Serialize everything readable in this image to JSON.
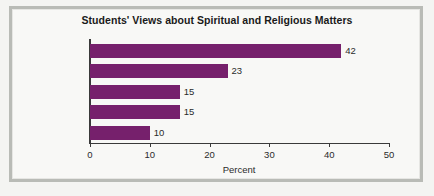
{
  "chart_data": {
    "type": "bar",
    "orientation": "horizontal",
    "title": "Students' Views about Spiritual and Religious Matters",
    "categories": [
      "Secure",
      "Seeking",
      "Conflicted",
      "Not interested",
      "Doubting"
    ],
    "values": [
      42,
      23,
      15,
      15,
      10
    ],
    "value_labels": [
      "42",
      "23",
      "15",
      "15",
      "10"
    ],
    "xlabel": "Percent",
    "ylabel": "",
    "xlim": [
      0,
      50
    ],
    "xticks": [
      0,
      10,
      20,
      30,
      40,
      50
    ],
    "xtick_labels": [
      "0",
      "10",
      "20",
      "30",
      "40",
      "50"
    ],
    "grid": false,
    "legend": false,
    "bar_color": "#76206c",
    "axis_color": "#3a3a3a",
    "background_color": "#f8f8f6",
    "frame_color": "#b9bbb6"
  }
}
